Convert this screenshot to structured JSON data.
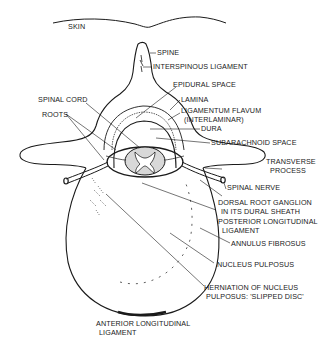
{
  "figure": {
    "labels": {
      "skin": "SKIN",
      "spine": "SPINE",
      "interspinous": "INTERSPINOUS LIGAMENT",
      "epidural": "EPIDURAL SPACE",
      "spinal_cord": "SPINAL CORD",
      "lamina": "LAMINA",
      "roots": "ROOTS",
      "lig_flavum_1": "LIGAMENTUM FLAVUM",
      "lig_flavum_2": "(INTERLAMINAR)",
      "dura": "DURA",
      "subarachnoid": "SUBARACHNOID SPACE",
      "transverse_1": "TRANSVERSE",
      "transverse_2": "PROCESS",
      "spinal_nerve": "SPINAL NERVE",
      "drg_1": "DORSAL ROOT GANGLION",
      "drg_2": "IN ITS DURAL SHEATH",
      "pll_1": "POSTERIOR LONGITUDINAL",
      "pll_2": "LIGAMENT",
      "annulus": "ANNULUS FIBROSUS",
      "nucleus": "NUCLEUS PULPOSUS",
      "herniation_1": "HERNIATION OF NUCLEUS",
      "herniation_2": "PULPOSUS: 'SLIPPED DISC'",
      "all_1": "ANTERIOR LONGITUDINAL",
      "all_2": "LIGAMENT"
    },
    "colors": {
      "ink": "#1a1a1a",
      "background": "#ffffff"
    }
  }
}
